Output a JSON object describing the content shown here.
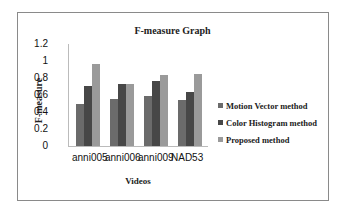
{
  "chart_data": {
    "type": "bar",
    "title": "F-measure Graph",
    "xlabel": "Videos",
    "ylabel": "F-measure",
    "ylim": [
      0,
      1.2
    ],
    "yticks": [
      "0",
      "0.2",
      "0.4",
      "0.6",
      "0.8",
      "1",
      "1.2"
    ],
    "categories": [
      "anni005",
      "anni006",
      "anni009",
      "NAD53"
    ],
    "series": [
      {
        "name": "Motion Vector method",
        "color": "#6b6b6b",
        "values": [
          0.49,
          0.55,
          0.59,
          0.54
        ]
      },
      {
        "name": "Color Histogram method",
        "color": "#474747",
        "values": [
          0.71,
          0.73,
          0.76,
          0.63
        ]
      },
      {
        "name": "Proposed method",
        "color": "#9a9a9a",
        "values": [
          0.96,
          0.73,
          0.84,
          0.85
        ]
      }
    ],
    "legend_position": "right",
    "grid": false
  }
}
